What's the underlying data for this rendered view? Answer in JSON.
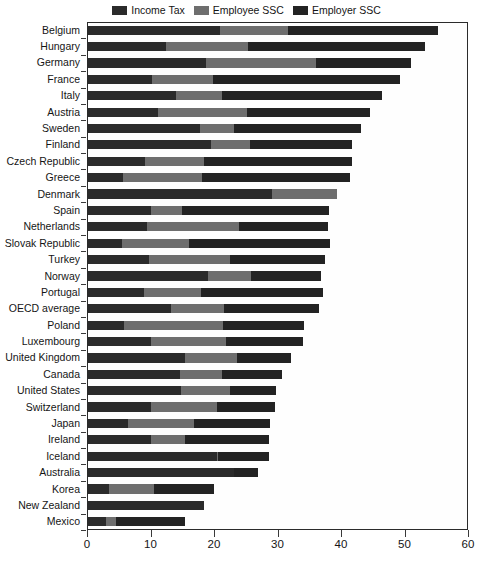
{
  "legend": {
    "position": "top-center",
    "items": [
      {
        "label": "Income Tax",
        "color": "#2b2b2b",
        "name": "legend-income-tax"
      },
      {
        "label": "Employee SSC",
        "color": "#6e6e6e",
        "name": "legend-employee-ssc"
      },
      {
        "label": "Employer SSC",
        "color": "#232323",
        "name": "legend-employer-ssc"
      }
    ]
  },
  "axes": {
    "x": {
      "min": 0,
      "max": 60,
      "ticks": [
        0,
        10,
        20,
        30,
        40,
        50,
        60
      ],
      "tick_labels": [
        "0",
        "10",
        "20",
        "30",
        "40",
        "50",
        "60"
      ],
      "label": ""
    },
    "y": {
      "label": "",
      "grid": false
    }
  },
  "chart_data": {
    "type": "bar",
    "orientation": "horizontal",
    "stacked": true,
    "title": "",
    "subtitle": "",
    "xlabel": "",
    "ylabel": "",
    "xlim": [
      0,
      60
    ],
    "grid": false,
    "legend_position": "top-center",
    "series_names": [
      "Income Tax",
      "Employee SSC",
      "Employer SSC"
    ],
    "series_colors": [
      "#2b2b2b",
      "#6e6e6e",
      "#232323"
    ],
    "categories": [
      "Belgium",
      "Hungary",
      "Germany",
      "France",
      "Italy",
      "Austria",
      "Sweden",
      "Finland",
      "Czech Republic",
      "Greece",
      "Denmark",
      "Spain",
      "Netherlands",
      "Slovak Republic",
      "Turkey",
      "Norway",
      "Portugal",
      "OECD average",
      "Poland",
      "Luxembourg",
      "United Kingdom",
      "Canada",
      "United States",
      "Switzerland",
      "Japan",
      "Ireland",
      "Iceland",
      "Australia",
      "Korea",
      "New Zealand",
      "Mexico"
    ],
    "series": [
      {
        "name": "Income Tax",
        "values": [
          21.0,
          12.5,
          18.7,
          10.3,
          14.0,
          11.2,
          17.8,
          19.6,
          9.1,
          5.6,
          29.2,
          10.0,
          9.5,
          5.5,
          9.7,
          19.0,
          9.0,
          13.3,
          5.9,
          10.1,
          15.4,
          14.7,
          14.8,
          10.0,
          6.5,
          10.0,
          20.5,
          23.2,
          3.5,
          18.5,
          3.0
        ]
      },
      {
        "name": "Employee SSC",
        "values": [
          10.7,
          12.8,
          17.3,
          9.6,
          7.2,
          14.0,
          5.3,
          6.1,
          9.3,
          12.5,
          10.2,
          4.9,
          14.5,
          10.6,
          12.8,
          6.9,
          8.9,
          8.3,
          15.5,
          11.8,
          8.3,
          6.6,
          7.7,
          10.4,
          10.4,
          5.5,
          0.2,
          0.0,
          7.0,
          0.0,
          1.5
        ]
      },
      {
        "name": "Employer SSC",
        "values": [
          23.6,
          27.9,
          15.0,
          29.4,
          25.3,
          19.3,
          20.0,
          16.1,
          23.4,
          23.3,
          0.0,
          23.2,
          14.0,
          22.1,
          15.0,
          11.0,
          19.2,
          14.9,
          12.8,
          12.1,
          8.5,
          9.4,
          7.3,
          9.2,
          11.9,
          13.1,
          8.0,
          3.8,
          9.5,
          0.0,
          11.0
        ]
      }
    ],
    "totals": [
      55.3,
      53.2,
      51.0,
      49.3,
      46.5,
      44.5,
      43.1,
      41.8,
      41.8,
      41.4,
      39.4,
      38.1,
      38.0,
      38.2,
      37.5,
      36.9,
      37.1,
      36.5,
      34.2,
      34.0,
      32.2,
      30.7,
      29.8,
      29.6,
      28.8,
      28.6,
      28.7,
      27.0,
      20.0,
      18.5,
      15.5
    ]
  }
}
